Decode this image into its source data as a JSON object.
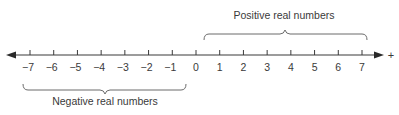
{
  "diagram": {
    "type": "number-line",
    "min": -7,
    "max": 7,
    "tick_labels": [
      "−7",
      "−6",
      "−5",
      "−4",
      "−3",
      "−2",
      "−1",
      "0",
      "1",
      "2",
      "3",
      "4",
      "5",
      "6",
      "7"
    ],
    "positive_direction_symbol": "+",
    "braces": {
      "positive": {
        "label": "Positive real numbers",
        "from": 0,
        "to": 7,
        "position": "above"
      },
      "negative": {
        "label": "Negative real numbers",
        "from": -7,
        "to": -1,
        "position": "below"
      }
    },
    "colors": {
      "line": "#3a3a3a",
      "text": "#3a3a3a",
      "brace": "#6b6b6b"
    }
  }
}
